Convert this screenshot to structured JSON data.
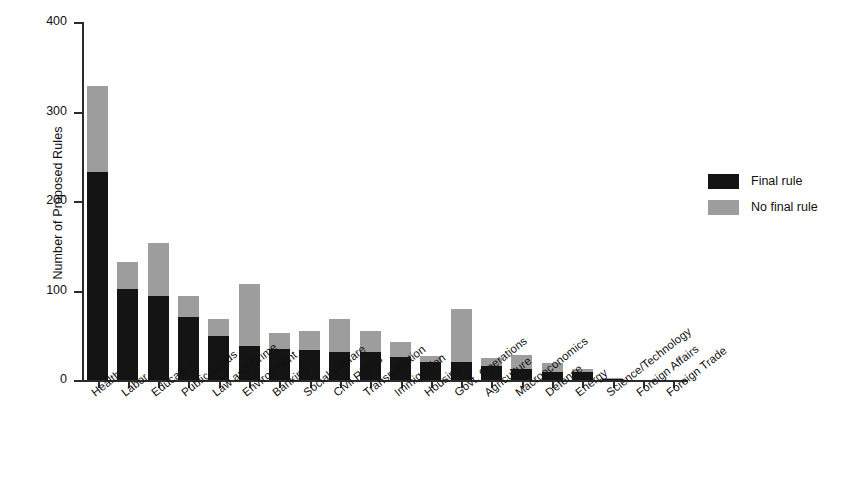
{
  "chart_data": {
    "type": "bar",
    "title": "",
    "subtitle": "",
    "xlabel": "",
    "ylabel": "Number of Proposed Rules",
    "ylim": [
      0,
      400
    ],
    "yticks": [
      0,
      100,
      200,
      300,
      400
    ],
    "ytick_labels": [
      "0",
      "100",
      "200",
      "300",
      "400"
    ],
    "grid": false,
    "stacked": true,
    "legend_position": "right",
    "categories": [
      "Health",
      "Labor",
      "Education",
      "Public Lands",
      "Law and Crime",
      "Environment",
      "Banking",
      "Social Welfare",
      "Civil Rights",
      "Transportation",
      "Immigration",
      "Housing",
      "Govt. Operations",
      "Agriculture",
      "Macroeconomics",
      "Defense",
      "Energy",
      "Science/Technology",
      "Foreign Affairs",
      "Foreign Trade"
    ],
    "series": [
      {
        "name": "Final rule",
        "color": "#141414",
        "values": [
          232,
          102,
          94,
          70,
          49,
          38,
          35,
          33,
          31,
          31,
          26,
          20,
          20,
          16,
          12,
          9,
          9,
          1,
          0,
          0
        ]
      },
      {
        "name": "No final rule",
        "color": "#9d9d9d",
        "values": [
          96,
          30,
          59,
          24,
          19,
          69,
          18,
          22,
          37,
          24,
          17,
          7,
          59,
          9,
          16,
          10,
          3,
          1,
          0,
          0
        ]
      }
    ],
    "totals": [
      328,
      132,
      153,
      94,
      68,
      107,
      53,
      55,
      68,
      55,
      43,
      27,
      79,
      25,
      28,
      19,
      12,
      2,
      0,
      0
    ]
  },
  "legend": {
    "items": [
      {
        "label": "Final rule",
        "color": "#141414"
      },
      {
        "label": "No final rule",
        "color": "#9d9d9d"
      }
    ]
  }
}
